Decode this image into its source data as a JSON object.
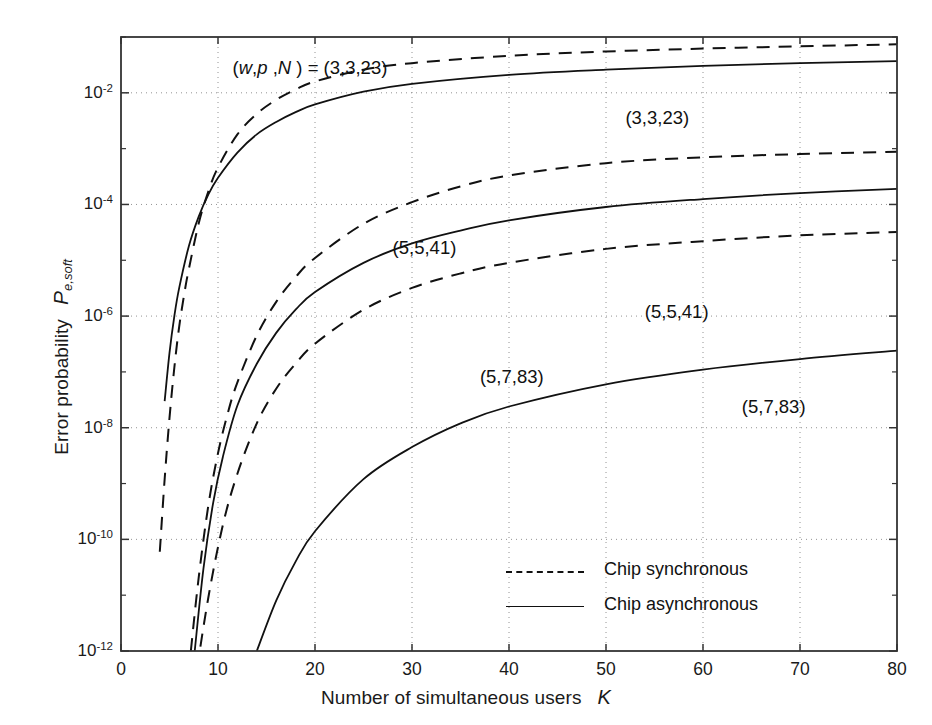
{
  "chart_data": {
    "type": "line",
    "title": "",
    "xlabel": "Number of simultaneous users",
    "xlabel_symbol": "K",
    "ylabel": "Error probability",
    "ylabel_symbol": "P",
    "ylabel_subscript": "e,soft",
    "xlim": [
      0,
      80
    ],
    "ylim": [
      1e-12,
      0.1
    ],
    "yscale": "log",
    "xscale": "linear",
    "xticks": [
      0,
      10,
      20,
      30,
      40,
      50,
      60,
      70,
      80
    ],
    "xtick_labels": [
      "0",
      "10",
      "20",
      "30",
      "40",
      "50",
      "60",
      "70",
      "80"
    ],
    "yticks": [
      0.01,
      0.0001,
      1e-06,
      1e-08,
      1e-10,
      1e-12
    ],
    "ytick_labels": [
      "10-2",
      "10-4",
      "10-6",
      "10-8",
      "10-10",
      "10-12"
    ],
    "ytick_mantissa": "10",
    "ytick_exponents": [
      "-2",
      "-4",
      "-6",
      "-8",
      "-10",
      "-12"
    ],
    "grid": true,
    "grid_style": "dotted",
    "legend": {
      "position": "bottom-center",
      "entries": [
        {
          "label": "Chip synchronous",
          "style": "dashed"
        },
        {
          "label": "Chip asynchronous",
          "style": "solid"
        }
      ]
    },
    "annotations": [
      {
        "id": "param-title",
        "text": "(w,p ,N ) = (3,3,23)",
        "x": 11.5,
        "y": 0.026,
        "italic_vars": [
          "w",
          "p",
          "N"
        ]
      },
      {
        "id": "label-33-23-async",
        "text": "(3,3,23)",
        "x": 52,
        "y": 0.0032
      },
      {
        "id": "label-55-41-sync",
        "text": "(5,5,41)",
        "x": 28,
        "y": 1.5e-05
      },
      {
        "id": "label-55-41-async",
        "text": "(5,5,41)",
        "x": 54,
        "y": 1.1e-06
      },
      {
        "id": "label-57-83-sync",
        "text": "(5,7,83)",
        "x": 37,
        "y": 7.5e-08
      },
      {
        "id": "label-57-83-async",
        "text": "(5,7,83)",
        "x": 64,
        "y": 2.2e-08
      }
    ],
    "series": [
      {
        "name": "(3,3,23) Chip synchronous",
        "params": [
          3,
          3,
          23
        ],
        "style": "dashed",
        "points": [
          [
            4.0,
            6e-11
          ],
          [
            4.5,
            1.2e-09
          ],
          [
            5.0,
            1.5e-08
          ],
          [
            5.5,
            1.2e-07
          ],
          [
            6.0,
            6.5e-07
          ],
          [
            6.6,
            3e-06
          ],
          [
            7.0,
            7e-06
          ],
          [
            8.0,
            4.5e-05
          ],
          [
            9.0,
            0.00017
          ],
          [
            10.0,
            0.00046
          ],
          [
            12.0,
            0.0018
          ],
          [
            14.0,
            0.0042
          ],
          [
            16.0,
            0.0075
          ],
          [
            18.0,
            0.0115
          ],
          [
            20.0,
            0.016
          ],
          [
            25.0,
            0.026
          ],
          [
            30.0,
            0.034
          ],
          [
            40.0,
            0.046
          ],
          [
            50.0,
            0.055
          ],
          [
            60.0,
            0.062
          ],
          [
            70.0,
            0.068
          ],
          [
            80.0,
            0.074
          ]
        ]
      },
      {
        "name": "(3,3,23) Chip asynchronous",
        "params": [
          3,
          3,
          23
        ],
        "style": "solid",
        "points": [
          [
            4.5,
            3e-08
          ],
          [
            5.0,
            2.2e-07
          ],
          [
            5.5,
            1e-06
          ],
          [
            6.0,
            3.2e-06
          ],
          [
            7.0,
            1.8e-05
          ],
          [
            8.0,
            6e-05
          ],
          [
            9.0,
            0.00015
          ],
          [
            10.0,
            0.0003
          ],
          [
            12.0,
            0.00085
          ],
          [
            14.0,
            0.0018
          ],
          [
            16.0,
            0.003
          ],
          [
            18.0,
            0.0045
          ],
          [
            20.0,
            0.0062
          ],
          [
            25.0,
            0.0105
          ],
          [
            30.0,
            0.0145
          ],
          [
            40.0,
            0.021
          ],
          [
            50.0,
            0.026
          ],
          [
            60.0,
            0.0305
          ],
          [
            70.0,
            0.034
          ],
          [
            80.0,
            0.037
          ]
        ]
      },
      {
        "name": "(5,5,41) Chip synchronous",
        "params": [
          5,
          5,
          41
        ],
        "style": "dashed",
        "points": [
          [
            7.2,
            1e-12
          ],
          [
            8.0,
            2e-11
          ],
          [
            9.0,
            4e-10
          ],
          [
            10.0,
            3.5e-09
          ],
          [
            11.0,
            1.8e-08
          ],
          [
            12.0,
            6.5e-08
          ],
          [
            14.0,
            4.5e-07
          ],
          [
            16.0,
            1.8e-06
          ],
          [
            18.0,
            5e-06
          ],
          [
            20.0,
            1.1e-05
          ],
          [
            25.0,
            4.5e-05
          ],
          [
            30.0,
            0.00011
          ],
          [
            35.0,
            0.00021
          ],
          [
            40.0,
            0.00033
          ],
          [
            50.0,
            0.00055
          ],
          [
            60.0,
            0.0007
          ],
          [
            70.0,
            0.0008
          ],
          [
            80.0,
            0.00088
          ]
        ]
      },
      {
        "name": "(5,5,41) Chip asynchronous",
        "params": [
          5,
          5,
          41
        ],
        "style": "solid",
        "points": [
          [
            7.6,
            1e-12
          ],
          [
            8.5,
            3e-11
          ],
          [
            9.5,
            4.5e-10
          ],
          [
            10.5,
            3e-09
          ],
          [
            12.0,
            2.5e-08
          ],
          [
            14.0,
            1.4e-07
          ],
          [
            16.0,
            5e-07
          ],
          [
            18.0,
            1.3e-06
          ],
          [
            20.0,
            2.7e-06
          ],
          [
            25.0,
            9e-06
          ],
          [
            30.0,
            2e-05
          ],
          [
            35.0,
            3.4e-05
          ],
          [
            40.0,
            5.2e-05
          ],
          [
            50.0,
            9e-05
          ],
          [
            60.0,
            0.000125
          ],
          [
            70.0,
            0.00016
          ],
          [
            80.0,
            0.00019
          ]
        ]
      },
      {
        "name": "(5,7,83) Chip synchronous",
        "params": [
          5,
          7,
          83
        ],
        "style": "dashed",
        "points": [
          [
            7.5,
            2e-13
          ],
          [
            9.0,
            9e-12
          ],
          [
            10.5,
            1.8e-10
          ],
          [
            12.0,
            1.5e-09
          ],
          [
            14.0,
            1.2e-08
          ],
          [
            16.0,
            5e-08
          ],
          [
            18.0,
            1.4e-07
          ],
          [
            20.0,
            3.2e-07
          ],
          [
            25.0,
            1.3e-06
          ],
          [
            30.0,
            3.2e-06
          ],
          [
            35.0,
            5.8e-06
          ],
          [
            40.0,
            9e-06
          ],
          [
            50.0,
            1.6e-05
          ],
          [
            60.0,
            2.2e-05
          ],
          [
            70.0,
            2.8e-05
          ],
          [
            80.0,
            3.2e-05
          ]
        ]
      },
      {
        "name": "(5,7,83) Chip asynchronous",
        "params": [
          5,
          7,
          83
        ],
        "style": "solid",
        "points": [
          [
            14.0,
            1e-12
          ],
          [
            16.0,
            8e-12
          ],
          [
            18.0,
            4e-11
          ],
          [
            20.0,
            1.4e-10
          ],
          [
            25.0,
            1.2e-09
          ],
          [
            30.0,
            4.5e-09
          ],
          [
            35.0,
            1.2e-08
          ],
          [
            40.0,
            2.4e-08
          ],
          [
            50.0,
            6e-08
          ],
          [
            60.0,
            1.1e-07
          ],
          [
            70.0,
            1.7e-07
          ],
          [
            80.0,
            2.4e-07
          ]
        ]
      }
    ],
    "colors": {
      "line": "#111111",
      "grid": "#808080",
      "axis": "#333333"
    }
  }
}
